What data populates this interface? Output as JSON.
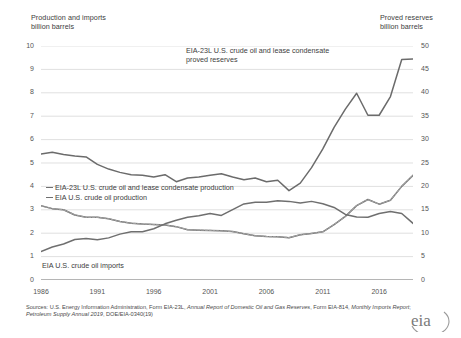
{
  "left_axis": {
    "title": "Production and imports\nbillion barrels",
    "ticks": [
      "0",
      "1",
      "2",
      "3",
      "4",
      "5",
      "6",
      "7",
      "8",
      "9",
      "10"
    ],
    "min": 0,
    "max": 10
  },
  "right_axis": {
    "title": "Proved reserves\nbillion barrels",
    "ticks": [
      "0",
      "5",
      "10",
      "15",
      "20",
      "25",
      "30",
      "35",
      "40",
      "45",
      "50"
    ],
    "min": 0,
    "max": 50
  },
  "annotations": {
    "reserves": "EIA-23L U.S. crude oil and lease condensate\nproved reserves",
    "production_lc": "EIA-23L U.S. crude oil and lease condensate production",
    "production": "EIA U.S. crude oil production",
    "imports": "EIA U.S. crude oil imports"
  },
  "xticks": [
    "1986",
    "1991",
    "1996",
    "2001",
    "2006",
    "2011",
    "2016"
  ],
  "source": {
    "prefix": "Sources: U.S. Energy Information Administration, Form EIA-23L, ",
    "italic1": "Annual Report of Domestic Oil and Gas Reserves",
    "mid": ", Form EIA-814, ",
    "italic2": "Monthly Imports Report",
    "mid2": "; ",
    "italic3": "Petroleum Supply Annual 2019",
    "suffix": ", DOE/EIA-0340(19)"
  },
  "logo": "eia",
  "colors": {
    "reserves": "#6b6b6b",
    "production_lc": "#6f6f6f",
    "production": "#8a8a8a",
    "imports": "#6f6f6f",
    "grid": "#d2d2d2",
    "axis": "#6a6a6a"
  },
  "chart_data": {
    "type": "line",
    "title": "",
    "xlabel": "",
    "ylabel": "billion barrels",
    "xlim": [
      1986,
      2019
    ],
    "ylim": [
      0,
      10
    ],
    "y2lim": [
      0,
      50
    ],
    "grid": true,
    "legend": "inline-annotations",
    "x": [
      1986,
      1987,
      1988,
      1989,
      1990,
      1991,
      1992,
      1993,
      1994,
      1995,
      1996,
      1997,
      1998,
      1999,
      2000,
      2001,
      2002,
      2003,
      2004,
      2005,
      2006,
      2007,
      2008,
      2009,
      2010,
      2011,
      2012,
      2013,
      2014,
      2015,
      2016,
      2017,
      2018,
      2019
    ],
    "series": [
      {
        "name": "EIA-23L U.S. crude oil and lease condensate proved reserves",
        "axis": "right",
        "unit": "billion barrels",
        "values": [
          26.9,
          27.3,
          26.8,
          26.5,
          26.3,
          24.7,
          23.7,
          23.0,
          22.5,
          22.4,
          22.0,
          22.5,
          21.0,
          21.8,
          22.0,
          22.4,
          22.7,
          22.0,
          21.4,
          21.8,
          21.0,
          21.3,
          19.1,
          20.7,
          24.0,
          28.0,
          32.6,
          36.5,
          39.9,
          35.2,
          35.2,
          39.2,
          47.1,
          47.2
        ]
      },
      {
        "name": "EIA-23L U.S. crude oil and lease condensate production",
        "axis": "left",
        "unit": "billion barrels",
        "values": [
          3.17,
          3.05,
          3.0,
          2.78,
          2.68,
          2.68,
          2.62,
          2.5,
          2.43,
          2.39,
          2.37,
          2.35,
          2.28,
          2.15,
          2.13,
          2.12,
          2.1,
          2.07,
          1.98,
          1.89,
          1.86,
          1.85,
          1.81,
          1.93,
          1.99,
          2.06,
          2.37,
          2.72,
          3.18,
          3.44,
          3.24,
          3.41,
          4.0,
          4.47
        ]
      },
      {
        "name": "EIA U.S. crude oil production",
        "axis": "left",
        "unit": "billion barrels",
        "values": [
          3.17,
          3.05,
          3.0,
          2.78,
          2.68,
          2.68,
          2.62,
          2.5,
          2.43,
          2.39,
          2.37,
          2.35,
          2.28,
          2.15,
          2.13,
          2.12,
          2.1,
          2.07,
          1.98,
          1.89,
          1.86,
          1.85,
          1.81,
          1.93,
          1.99,
          2.06,
          2.37,
          2.72,
          3.18,
          3.44,
          3.24,
          3.41,
          4.0,
          4.47
        ]
      },
      {
        "name": "EIA U.S. crude oil imports",
        "axis": "left",
        "unit": "billion barrels",
        "values": [
          1.22,
          1.41,
          1.54,
          1.73,
          1.77,
          1.72,
          1.8,
          1.96,
          2.06,
          2.06,
          2.19,
          2.4,
          2.55,
          2.68,
          2.75,
          2.84,
          2.76,
          3.01,
          3.25,
          3.32,
          3.32,
          3.39,
          3.36,
          3.29,
          3.36,
          3.26,
          3.1,
          2.8,
          2.69,
          2.68,
          2.84,
          2.93,
          2.84,
          2.42
        ]
      }
    ]
  }
}
